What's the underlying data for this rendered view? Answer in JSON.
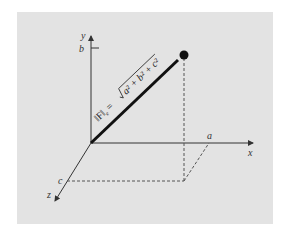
{
  "diagram": {
    "panel_color": "#e3e3e3",
    "axes": {
      "x": {
        "label": "x",
        "tick_label": "a"
      },
      "y": {
        "label": "y",
        "tick_label": "b"
      },
      "z": {
        "label": "z",
        "tick_label": "c"
      }
    },
    "vector": {
      "formula_lhs": "‖F‖",
      "formula_sub": "e",
      "formula_eq": " = ",
      "formula_rhs": "a² + b² + c²"
    },
    "colors": {
      "axis": "#333333",
      "vector": "#111111",
      "dashed": "#555555"
    }
  }
}
